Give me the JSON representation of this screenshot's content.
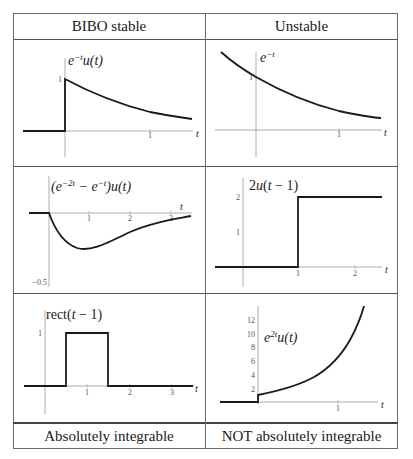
{
  "table": {
    "header": {
      "left": "BIBO stable",
      "right": "Unstable"
    },
    "footer": {
      "left": "Absolutely integrable",
      "right": "NOT absolutely integrable"
    }
  },
  "plots": [
    {
      "id": "top-left",
      "label_text": "e^{-t}u(t)",
      "label_base": "e",
      "label_sup": "−t",
      "label_rest": "u(t)",
      "y_ticks": [
        "1"
      ],
      "x_ticks": [
        "1"
      ],
      "x_axis_label": "t"
    },
    {
      "id": "top-right",
      "label_text": "e^{-t}",
      "label_base": "e",
      "label_sup": "−t",
      "label_rest": "",
      "y_ticks": [
        "1"
      ],
      "x_ticks": [
        "1"
      ],
      "x_axis_label": "t"
    },
    {
      "id": "middle-left",
      "label_text": "(e^{-2t} − e^{-t})u(t)",
      "label_part1": "(e",
      "label_sup1": "−2t",
      "label_part2": " − e",
      "label_sup2": "−t",
      "label_part3": ")u(t)",
      "y_ticks": [
        "−0.5"
      ],
      "x_ticks": [
        "1",
        "2",
        "3"
      ],
      "x_axis_label": "t"
    },
    {
      "id": "middle-right",
      "label_text": "2u(t − 1)",
      "label_a": "2",
      "label_b": "u",
      "label_c": "(",
      "label_d": "t",
      "label_e": " − 1)",
      "y_ticks": [
        "1",
        "2"
      ],
      "x_ticks": [
        "1",
        "2"
      ],
      "x_axis_label": "t"
    },
    {
      "id": "bottom-left",
      "label_text": "rect(t − 1)",
      "label_a": "rect(",
      "label_b": "t",
      "label_c": " − 1)",
      "y_ticks": [
        "1"
      ],
      "x_ticks": [
        "1",
        "2",
        "3"
      ],
      "x_axis_label": "t"
    },
    {
      "id": "bottom-right",
      "label_text": "e^{2t}u(t)",
      "label_base": "e",
      "label_sup": "2t",
      "label_rest": "u(t)",
      "y_ticks": [
        "2",
        "4",
        "6",
        "8",
        "10",
        "12"
      ],
      "x_ticks": [
        "1"
      ],
      "x_axis_label": "t"
    }
  ],
  "colors": {
    "curve": "#1a1a1a",
    "axis": "#9a9a9a",
    "border": "#555555"
  }
}
